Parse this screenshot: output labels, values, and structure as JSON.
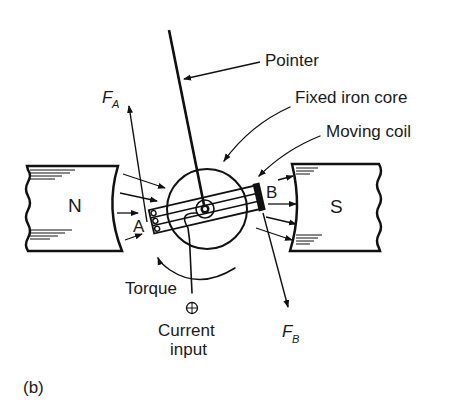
{
  "figure": {
    "panel_label": "(b)"
  },
  "labels": {
    "pointer": "Pointer",
    "fixed_iron_core": "Fixed iron core",
    "moving_coil": "Moving coil",
    "force_a_main": "F",
    "force_a_sub": "A",
    "force_b_main": "F",
    "force_b_sub": "B",
    "side_a": "A",
    "side_b": "B",
    "torque": "Torque",
    "current_line1": "Current",
    "current_line2": "input"
  },
  "magnets": {
    "north": {
      "label": "N"
    },
    "south": {
      "label": "S"
    }
  },
  "colors": {
    "ink": "#111111",
    "background": "#ffffff"
  }
}
